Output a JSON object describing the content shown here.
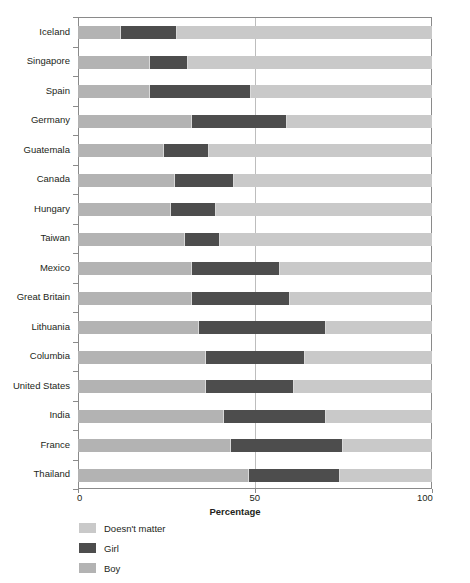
{
  "chart_data": {
    "type": "bar",
    "orientation": "horizontal",
    "stacked": true,
    "title": "",
    "xlabel": "Percentage",
    "ylabel": "",
    "xlim": [
      0,
      100
    ],
    "xticks": [
      0,
      50,
      100
    ],
    "xtick_labels": [
      "0",
      "50",
      "100"
    ],
    "grid": "vertical-midline-only",
    "legend_position": "below-axis-left",
    "categories": [
      "Iceland",
      "Singapore",
      "Spain",
      "Germany",
      "Guatemala",
      "Canada",
      "Hungary",
      "Taiwan",
      "Mexico",
      "Great Britain",
      "Lithuania",
      "Columbia",
      "United States",
      "India",
      "France",
      "Thailand"
    ],
    "series": [
      {
        "name": "Boy",
        "color": "#b3b3b3",
        "values": [
          12,
          20,
          20,
          32,
          24,
          27,
          26,
          30,
          32,
          32,
          34,
          36,
          36,
          41,
          43,
          48
        ]
      },
      {
        "name": "Girl",
        "color": "#4d4d4d",
        "values": [
          16,
          11,
          29,
          27,
          13,
          17,
          13,
          10,
          25,
          28,
          36,
          28,
          25,
          29,
          32,
          26
        ]
      },
      {
        "name": "Doesn't matter",
        "color": "#c9c9c9",
        "values": [
          72,
          69,
          51,
          41,
          63,
          56,
          61,
          60,
          43,
          40,
          30,
          36,
          39,
          30,
          25,
          26
        ]
      }
    ],
    "cumulative_boundaries": {
      "note": "boy_end / girl_end as percent of axis",
      "Iceland": [
        12,
        28
      ],
      "Singapore": [
        20,
        31
      ],
      "Spain": [
        20,
        49
      ],
      "Germany": [
        32,
        59
      ],
      "Guatemala": [
        24,
        37
      ],
      "Canada": [
        27,
        44
      ],
      "Hungary": [
        26,
        39
      ],
      "Taiwan": [
        30,
        40
      ],
      "Mexico": [
        32,
        57
      ],
      "Great Britain": [
        32,
        60
      ],
      "Lithuania": [
        34,
        70
      ],
      "Columbia": [
        36,
        64
      ],
      "United States": [
        36,
        61
      ],
      "India": [
        41,
        70
      ],
      "France": [
        43,
        75
      ],
      "Thailand": [
        48,
        74
      ]
    }
  },
  "legend": {
    "items": [
      {
        "label": "Doesn't matter",
        "color": "#c9c9c9"
      },
      {
        "label": "Girl",
        "color": "#4d4d4d"
      },
      {
        "label": "Boy",
        "color": "#b3b3b3"
      }
    ]
  },
  "axis": {
    "x_title": "Percentage",
    "x_tick_0": "0",
    "x_tick_50": "50",
    "x_tick_100": "100"
  },
  "colors": {
    "boy": "#b3b3b3",
    "girl": "#4d4d4d",
    "doesnt_matter": "#c9c9c9",
    "axis": "#8a8a8a",
    "gridline": "#bdbdbd",
    "text": "#231f20",
    "background": "#ffffff"
  }
}
